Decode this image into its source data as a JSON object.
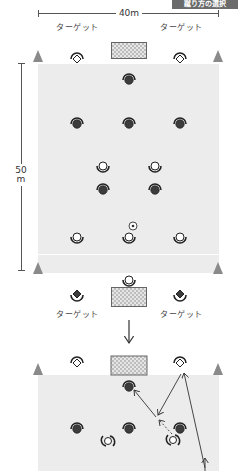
{
  "header": {
    "tag": "蹴り方の選択"
  },
  "dimensions": {
    "width_label": "40m",
    "length_value": "50",
    "length_unit": "m"
  },
  "labels": {
    "target_top_left": "ターゲット",
    "target_top_right": "ターゲット",
    "target_bottom_left": "ターゲット",
    "target_bottom_right": "ターゲット"
  },
  "colors": {
    "field": "#ececec",
    "cone": "#8a8a8a",
    "dark_player": "#3c3c3c",
    "header_bg": "#6b6b6b"
  },
  "diagram1": {
    "dark_players": [
      [
        129,
        78
      ],
      [
        77,
        122
      ],
      [
        129,
        122
      ],
      [
        180,
        122
      ],
      [
        103,
        188
      ],
      [
        155,
        188
      ]
    ],
    "white_players": [
      [
        103,
        166
      ],
      [
        155,
        166
      ],
      [
        77,
        237
      ],
      [
        129,
        237
      ],
      [
        180,
        237
      ],
      [
        129,
        280
      ]
    ],
    "ball": [
      129,
      226
    ],
    "targets_top": [
      [
        77,
        58
      ],
      [
        180,
        58
      ]
    ],
    "targets_bottom": [
      [
        77,
        295
      ],
      [
        180,
        295
      ]
    ]
  },
  "diagram2": {
    "dark_players": [
      [
        129,
        385
      ],
      [
        77,
        427
      ],
      [
        129,
        427
      ],
      [
        180,
        427
      ]
    ],
    "white_players": [
      [
        107,
        441
      ],
      [
        173,
        439
      ]
    ],
    "targets_top": [
      [
        77,
        362
      ],
      [
        180,
        362
      ]
    ]
  }
}
